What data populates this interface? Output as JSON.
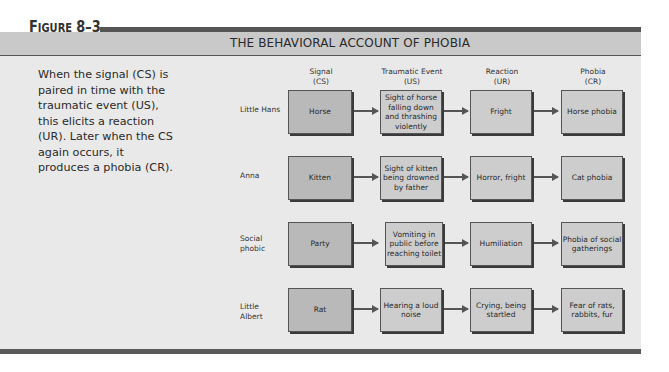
{
  "figure": {
    "label_prefix": "F",
    "label_rest": "IGURE",
    "label_number": "8–3",
    "title": "THE BEHAVIORAL ACCOUNT OF PHOBIA"
  },
  "caption": "When the signal (CS) is paired in time with the traumatic event (US), this elicits a reaction (UR). Later when the CS again occurs, it produces a phobia (CR).",
  "columns": [
    {
      "line1": "Signal",
      "line2": "(CS)"
    },
    {
      "line1": "Traumatic Event",
      "line2": "(US)"
    },
    {
      "line1": "Reaction",
      "line2": "(UR)"
    },
    {
      "line1": "Phobia",
      "line2": "(CR)"
    }
  ],
  "rows": [
    {
      "label": "Little Hans",
      "signal": "Horse",
      "event": "Sight of horse falling down and thrashing violently",
      "reaction": "Fright",
      "phobia": "Horse phobia"
    },
    {
      "label": "Anna",
      "signal": "Kitten",
      "event": "Sight of kitten being drowned by father",
      "reaction": "Horror, fright",
      "phobia": "Cat phobia"
    },
    {
      "label": "Social phobic",
      "signal": "Party",
      "event": "Vomiting in public before reaching toilet",
      "reaction": "Humiliation",
      "phobia": "Phobia of social gatherings"
    },
    {
      "label": "Little Albert",
      "signal": "Rat",
      "event": "Hearing a loud noise",
      "reaction": "Crying, being startled",
      "phobia": "Fear of rats, rabbits, fur"
    }
  ],
  "colors": {
    "header_band": "#c9c9c9",
    "panel": "#e9e9e9",
    "box_fill": "#c4c4c4",
    "rule": "#555555"
  }
}
